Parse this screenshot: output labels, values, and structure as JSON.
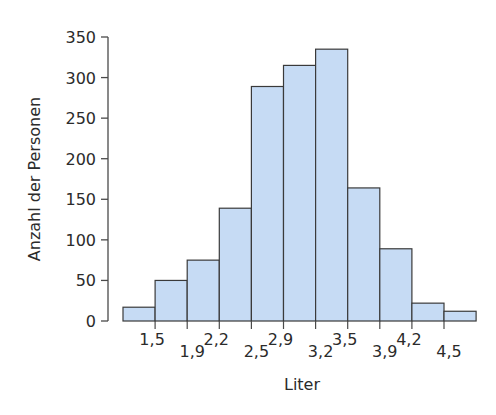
{
  "chart_data": {
    "type": "bar",
    "subtype": "histogram",
    "title": "",
    "xlabel": "Liter",
    "ylabel": "Anzahl der Personen",
    "ylim": [
      0,
      350
    ],
    "yticks": [
      0,
      50,
      100,
      150,
      200,
      250,
      300,
      350
    ],
    "xtick_labels": [
      "1,5",
      "1,9",
      "2,2",
      "2,5",
      "2,9",
      "3,2",
      "3,5",
      "3,9",
      "4,2",
      "4,5"
    ],
    "xtick_label_rows": [
      "upper",
      "lower",
      "upper",
      "lower",
      "upper",
      "lower",
      "upper",
      "lower",
      "upper",
      "lower"
    ],
    "bins": [
      {
        "from": null,
        "to": "1,5",
        "value": 17
      },
      {
        "from": "1,5",
        "to": "1,9",
        "value": 50
      },
      {
        "from": "1,9",
        "to": "2,2",
        "value": 75
      },
      {
        "from": "2,2",
        "to": "2,5",
        "value": 139
      },
      {
        "from": "2,5",
        "to": "2,9",
        "value": 289
      },
      {
        "from": "2,9",
        "to": "3,2",
        "value": 315
      },
      {
        "from": "3,2",
        "to": "3,5",
        "value": 335
      },
      {
        "from": "3,5",
        "to": "3,9",
        "value": 164
      },
      {
        "from": "3,9",
        "to": "4,2",
        "value": 89
      },
      {
        "from": "4,2",
        "to": "4,5",
        "value": 22
      },
      {
        "from": "4,5",
        "to": null,
        "value": 12
      }
    ],
    "values": [
      17,
      50,
      75,
      139,
      289,
      315,
      335,
      164,
      89,
      22,
      12
    ],
    "grid": false,
    "legend": null,
    "colors": {
      "bar_fill": "#c6dbf4",
      "bar_stroke": "#3a3a3a",
      "axis": "#4a4a4a",
      "text": "#2b2b2b"
    }
  }
}
